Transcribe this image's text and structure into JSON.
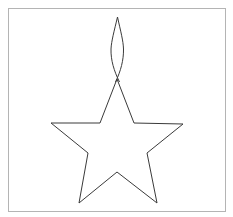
{
  "document": {
    "title": "Star Outline Drawing",
    "background_color": "#ffffff",
    "width": 233,
    "height": 217
  },
  "frame": {
    "name": "border-frame",
    "x": 8.5,
    "y": 8.5,
    "width": 217,
    "height": 203,
    "stroke_color": "#b4b4b4",
    "stroke_width": 1,
    "fill": "none"
  },
  "figure": {
    "name": "five-pointed-star-with-antenna-spike",
    "stroke_color": "#3a3a3a",
    "stroke_width": 1,
    "fill": "none",
    "star_body": {
      "description": "Five-pointed star outline, upright, open at the top vertex where the spike meets it",
      "points_note": "Outer tips: top (117,79), left (51,123), right (183,124), bottom-left (79,203), bottom-right (157,203). Inner vertices: upper-left (100,123), upper-right (134,123), lower-left (88,153), lower-right (147,153), bottom (117,172)",
      "path": "M 117 79 L 134 123 L 183 124 L 147 153 L 157 203 L 117 172 L 79 203 L 88 153 L 51 123 L 100 123 Z"
    },
    "spike": {
      "description": "Narrow lens / almond shaped spike rising from the star's top vertex, crossing slightly below its base",
      "apex": {
        "x": 117.5,
        "y": 17
      },
      "widest": {
        "y": 49,
        "left_x": 111,
        "right_x": 123.5
      },
      "base": {
        "x": 117.5,
        "y": 82
      },
      "path_left": "M 117.5 17 C 114.2 31 111.4 41 111.0 49 C 110.7 60 114.0 71 119.5 82",
      "path_right": "M 117.5 17 C 120.6 31 123.3 41 123.5 49 C 123.7 60 120.8 71 115.5 82"
    }
  }
}
